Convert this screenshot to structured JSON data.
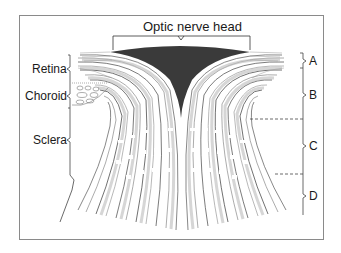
{
  "diagram": {
    "title_label": "Optic nerve head",
    "left_labels": [
      {
        "name": "retina",
        "text": "Retina"
      },
      {
        "name": "choroid",
        "text": "Choroid"
      },
      {
        "name": "sclera",
        "text": "Sclera"
      }
    ],
    "right_labels": [
      {
        "name": "region-a",
        "text": "A"
      },
      {
        "name": "region-b",
        "text": "B"
      },
      {
        "name": "region-c",
        "text": "C"
      },
      {
        "name": "region-d",
        "text": "D"
      }
    ],
    "colors": {
      "line": "#333333",
      "fiber_dark": "#3a3a3a",
      "fiber_light": "#bdbdbd",
      "frame": "#8a8a8a"
    }
  }
}
